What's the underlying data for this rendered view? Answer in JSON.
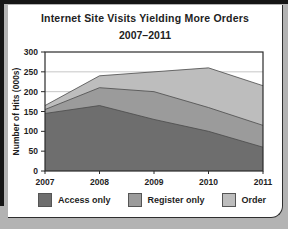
{
  "chart_data": {
    "type": "area",
    "stacked": true,
    "title": "Internet Site Visits Yielding More Orders",
    "subtitle": "2007–2011",
    "xlabel": "",
    "ylabel": "Number of Hits (000s)",
    "x": [
      "2007",
      "2008",
      "2009",
      "2010",
      "2011"
    ],
    "series": [
      {
        "name": "Access only",
        "color": "#6e6e6e",
        "values": [
          145,
          165,
          130,
          100,
          60
        ]
      },
      {
        "name": "Register only",
        "color": "#9b9b9b",
        "values": [
          10,
          45,
          70,
          60,
          55
        ]
      },
      {
        "name": "Order",
        "color": "#bdbdbd",
        "values": [
          10,
          30,
          50,
          100,
          100
        ]
      }
    ],
    "cumulative_tops": {
      "access_only": [
        145,
        165,
        130,
        100,
        60
      ],
      "register_only": [
        155,
        210,
        200,
        160,
        115
      ],
      "order": [
        165,
        240,
        250,
        260,
        215
      ]
    },
    "ylim": [
      0,
      300
    ],
    "yticks": [
      0,
      50,
      100,
      150,
      200,
      250,
      300
    ],
    "grid": true,
    "legend_position": "bottom",
    "colors": {
      "grid": "#c6c6c6",
      "axis": "#2b2b2b",
      "edge": "#4a4a4a",
      "plot_bg": "#ffffff"
    }
  }
}
